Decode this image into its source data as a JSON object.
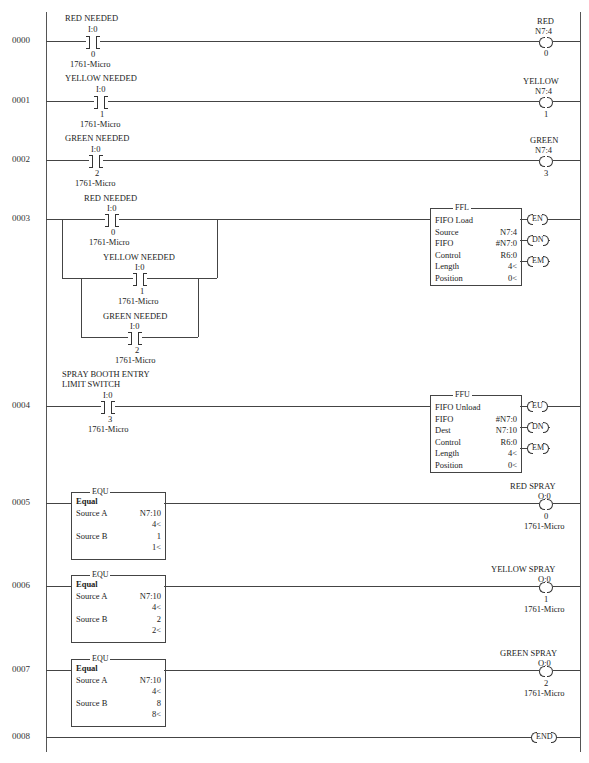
{
  "rungs": [
    {
      "number": "0000",
      "contact": {
        "label": "RED NEEDED",
        "addr": "I:0",
        "bit": "0",
        "module": "1761-Micro"
      },
      "coil": {
        "label": "RED",
        "addr": "N7:4",
        "bit": "0"
      }
    },
    {
      "number": "0001",
      "contact": {
        "label": "YELLOW NEEDED",
        "addr": "I:0",
        "bit": "1",
        "module": "1761-Micro"
      },
      "coil": {
        "label": "YELLOW",
        "addr": "N7:4",
        "bit": "1"
      }
    },
    {
      "number": "0002",
      "contact": {
        "label": "GREEN NEEDED",
        "addr": "I:0",
        "bit": "2",
        "module": "1761-Micro"
      },
      "coil": {
        "label": "GREEN",
        "addr": "N7:4",
        "bit": "3"
      }
    },
    {
      "number": "0003",
      "contacts": [
        {
          "label": "RED NEEDED",
          "addr": "I:0",
          "bit": "0",
          "module": "1761-Micro"
        },
        {
          "label": "YELLOW NEEDED",
          "addr": "I:0",
          "bit": "1",
          "module": "1761-Micro"
        },
        {
          "label": "GREEN NEEDED",
          "addr": "I:0",
          "bit": "2",
          "module": "1761-Micro"
        }
      ],
      "block": {
        "mnemonic": "FFL",
        "name": "FIFO Load",
        "params": [
          [
            "Source",
            "N7:4"
          ],
          [
            "FIFO",
            "#N7:0"
          ],
          [
            "Control",
            "R6:0"
          ],
          [
            "Length",
            "4<"
          ],
          [
            "Position",
            "0<"
          ]
        ],
        "outputs": [
          "EN",
          "DN",
          "EM"
        ]
      }
    },
    {
      "number": "0004",
      "contact": {
        "label1": "SPRAY BOOTH ENTRY",
        "label2": "LIMIT SWITCH",
        "addr": "I:0",
        "bit": "3",
        "module": "1761-Micro"
      },
      "block": {
        "mnemonic": "FFU",
        "name": "FIFO Unload",
        "params": [
          [
            "FIFO",
            "#N7:0"
          ],
          [
            "Dest",
            "N7:10"
          ],
          [
            "Control",
            "R6:0"
          ],
          [
            "Length",
            "4<"
          ],
          [
            "Position",
            "0<"
          ]
        ],
        "outputs": [
          "EU",
          "DN",
          "EM"
        ]
      }
    },
    {
      "number": "0005",
      "block": {
        "mnemonic": "EQU",
        "name": "Equal",
        "source_a": "N7:10",
        "source_a_val": "4<",
        "source_b": "1",
        "source_b_val": "1<",
        "source_a_label": "Source A",
        "source_b_label": "Source B"
      },
      "coil": {
        "label": "RED SPRAY",
        "addr": "O:0",
        "bit": "0",
        "module": "1761-Micro"
      }
    },
    {
      "number": "0006",
      "block": {
        "mnemonic": "EQU",
        "name": "Equal",
        "source_a": "N7:10",
        "source_a_val": "4<",
        "source_b": "2",
        "source_b_val": "2<",
        "source_a_label": "Source A",
        "source_b_label": "Source B"
      },
      "coil": {
        "label": "YELLOW SPRAY",
        "addr": "O:0",
        "bit": "1",
        "module": "1761-Micro"
      }
    },
    {
      "number": "0007",
      "block": {
        "mnemonic": "EQU",
        "name": "Equal",
        "source_a": "N7:10",
        "source_a_val": "4<",
        "source_b": "8",
        "source_b_val": "8<",
        "source_a_label": "Source A",
        "source_b_label": "Source B"
      },
      "coil": {
        "label": "GREEN SPRAY",
        "addr": "O:0",
        "bit": "2",
        "module": "1761-Micro"
      }
    },
    {
      "number": "0008",
      "end": "END"
    }
  ]
}
